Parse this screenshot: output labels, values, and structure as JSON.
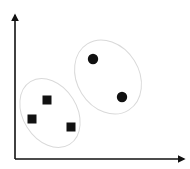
{
  "diagram": {
    "type": "cluster-scatter",
    "background": "#ffffff",
    "axis_color": "#111111",
    "cluster_outline_color": "#d9d9d9",
    "marker_color": "#111111",
    "axes": {
      "origin": [
        15,
        159
      ],
      "y_axis_top": [
        15,
        15
      ],
      "x_axis_end": [
        184,
        159
      ]
    },
    "clusters": [
      {
        "name": "square-cluster",
        "ellipse": {
          "cx": 50,
          "cy": 113,
          "rx": 27,
          "ry": 37,
          "rotate": -32
        },
        "points": [
          {
            "shape": "square",
            "x": 47,
            "y": 100
          },
          {
            "shape": "square",
            "x": 32,
            "y": 119
          },
          {
            "shape": "square",
            "x": 71,
            "y": 127
          }
        ]
      },
      {
        "name": "circle-cluster",
        "ellipse": {
          "cx": 108,
          "cy": 77,
          "rx": 31,
          "ry": 39,
          "rotate": -32
        },
        "points": [
          {
            "shape": "circle",
            "x": 93,
            "y": 59
          },
          {
            "shape": "circle",
            "x": 122,
            "y": 97
          }
        ]
      }
    ]
  }
}
